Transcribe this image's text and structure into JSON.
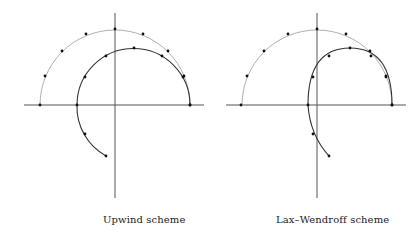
{
  "figure": {
    "panels": [
      {
        "id": "upwind",
        "caption": "Upwind scheme",
        "origin": [
          115,
          105
        ],
        "axis": {
          "x_from": 24,
          "x_to": 204,
          "y_from": 13,
          "y_to": 198
        },
        "outer_circle": {
          "cx": 115,
          "cy": 105,
          "r": 75
        },
        "outer_points": [
          [
            40,
            105
          ],
          [
            45,
            76
          ],
          [
            62,
            51
          ],
          [
            86,
            34
          ],
          [
            115,
            29
          ],
          [
            143,
            34
          ],
          [
            168,
            51
          ],
          [
            183,
            77
          ],
          [
            190,
            105
          ]
        ],
        "inner_curve_path": "M 106 156 A 56 56 0 0 1 77 105 A 56 56 0 0 1 190 105",
        "inner_points": [
          [
            106,
            156
          ],
          [
            85,
            134
          ],
          [
            77,
            105
          ],
          [
            85,
            77
          ],
          [
            106,
            56
          ],
          [
            134,
            48
          ],
          [
            162,
            56
          ],
          [
            184,
            76
          ],
          [
            190,
            105
          ]
        ]
      },
      {
        "id": "lax-wendroff",
        "caption": "Lax–Wendroff scheme",
        "origin": [
          317,
          105
        ],
        "axis": {
          "x_from": 226,
          "x_to": 406,
          "y_from": 13,
          "y_to": 198
        },
        "outer_circle": {
          "cx": 317,
          "cy": 105,
          "r": 75
        },
        "outer_points": [
          [
            241,
            105
          ],
          [
            247,
            76
          ],
          [
            264,
            51
          ],
          [
            288,
            34
          ],
          [
            317,
            29
          ],
          [
            346,
            34
          ],
          [
            370,
            51
          ],
          [
            386,
            76
          ],
          [
            392,
            105
          ]
        ],
        "inner_curve_path": "M 329 156 Q 310 135 308 105 Q 308 48 350 48 Q 392 48 392 105",
        "inner_points": [
          [
            329,
            156
          ],
          [
            313,
            134
          ],
          [
            308,
            105
          ],
          [
            313,
            77
          ],
          [
            329,
            56
          ],
          [
            350,
            48
          ],
          [
            371,
            56
          ],
          [
            386,
            77
          ],
          [
            392,
            105
          ]
        ]
      }
    ],
    "colors": {
      "axis": "#555555",
      "outer": "#9a9a9a",
      "inner": "#333333",
      "dot": "#111111"
    }
  }
}
